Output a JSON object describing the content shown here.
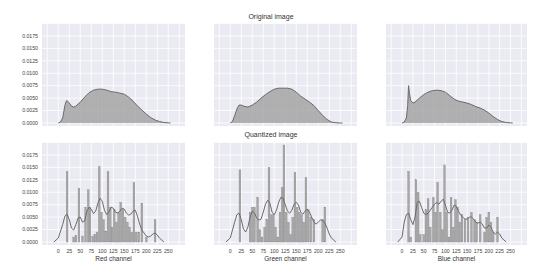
{
  "figure": {
    "titles": [
      "Original image",
      "Quantized image"
    ],
    "colors": {
      "background": "#eaeaf2",
      "grid": "#ffffff",
      "bar": "#9a9a9a",
      "line": "#6b6b6b",
      "fill": "#9a9a9a",
      "text": "#444444"
    }
  },
  "chart_data": [
    {
      "type": "area",
      "panel": "original-red",
      "title": "Original image",
      "xlabel": "",
      "ylabel": "",
      "ylim": [
        0,
        0.0201
      ],
      "xlim": [
        -37,
        288
      ],
      "yticks": [
        "0.0000",
        "0.0025",
        "0.0050",
        "0.0075",
        "0.0100",
        "0.0125",
        "0.0150",
        "0.0175"
      ],
      "x": [
        0,
        5,
        10,
        15,
        18,
        20,
        25,
        30,
        35,
        40,
        50,
        60,
        70,
        80,
        90,
        100,
        110,
        120,
        130,
        140,
        150,
        160,
        170,
        180,
        190,
        200,
        210,
        220,
        230,
        240,
        250,
        255
      ],
      "values": [
        0,
        0.0002,
        0.001,
        0.0035,
        0.0044,
        0.0045,
        0.004,
        0.0034,
        0.0032,
        0.0034,
        0.0042,
        0.0052,
        0.0061,
        0.0066,
        0.0068,
        0.0068,
        0.0066,
        0.0063,
        0.0062,
        0.006,
        0.0058,
        0.0052,
        0.0044,
        0.0034,
        0.0026,
        0.0018,
        0.0011,
        0.0006,
        0.0003,
        0.0001,
        3e-05,
        0
      ]
    },
    {
      "type": "area",
      "panel": "original-green",
      "title": "Original image",
      "ylim": [
        0,
        0.0201
      ],
      "xlim": [
        -37,
        288
      ],
      "x": [
        0,
        5,
        10,
        15,
        20,
        25,
        30,
        40,
        50,
        60,
        70,
        80,
        90,
        100,
        110,
        120,
        130,
        140,
        150,
        160,
        170,
        180,
        190,
        200,
        210,
        220,
        230,
        240,
        250,
        255
      ],
      "values": [
        0,
        0.0003,
        0.0015,
        0.0028,
        0.0036,
        0.0036,
        0.0034,
        0.0032,
        0.0036,
        0.0042,
        0.005,
        0.0057,
        0.0063,
        0.0068,
        0.007,
        0.007,
        0.007,
        0.0068,
        0.0062,
        0.0054,
        0.0048,
        0.0042,
        0.0035,
        0.0025,
        0.0015,
        0.0007,
        0.0002,
        5e-05,
        0,
        0
      ]
    },
    {
      "type": "area",
      "panel": "original-blue",
      "title": "Original image",
      "ylim": [
        0,
        0.0201
      ],
      "xlim": [
        -37,
        288
      ],
      "x": [
        0,
        5,
        10,
        13,
        15,
        17,
        20,
        25,
        30,
        40,
        50,
        60,
        70,
        80,
        90,
        100,
        110,
        120,
        130,
        140,
        150,
        160,
        170,
        180,
        190,
        200,
        210,
        220,
        230,
        240,
        250,
        255
      ],
      "values": [
        0,
        0.0002,
        0.001,
        0.0035,
        0.0075,
        0.006,
        0.0045,
        0.004,
        0.0042,
        0.005,
        0.0057,
        0.0062,
        0.0065,
        0.0066,
        0.0065,
        0.0062,
        0.0055,
        0.0048,
        0.0044,
        0.0042,
        0.004,
        0.0037,
        0.0033,
        0.003,
        0.0026,
        0.002,
        0.0013,
        0.0007,
        0.0003,
        0.0001,
        3e-05,
        0
      ]
    },
    {
      "type": "bar+kde",
      "panel": "quantized-red",
      "title": "Quantized image",
      "xlabel": "Red channel",
      "ylim": [
        0,
        0.0201
      ],
      "xlim": [
        -37,
        288
      ],
      "xticks": [
        "0",
        "25",
        "50",
        "75",
        "100",
        "125",
        "150",
        "175",
        "200",
        "225",
        "250"
      ],
      "yticks": [
        "0.0000",
        "0.0025",
        "0.0050",
        "0.0075",
        "0.0100",
        "0.0125",
        "0.0150",
        "0.0175"
      ],
      "bars": {
        "x": [
          20,
          35,
          40,
          47,
          55,
          62,
          68,
          72,
          78,
          83,
          88,
          93,
          98,
          103,
          108,
          113,
          118,
          122,
          127,
          132,
          137,
          142,
          147,
          152,
          157,
          162,
          167,
          172,
          177,
          183,
          190,
          200,
          220
        ],
        "values": [
          0.0142,
          0.001,
          0.0013,
          0.0108,
          0.0012,
          0.007,
          0.0105,
          0.007,
          0.0012,
          0.0015,
          0.002,
          0.0152,
          0.006,
          0.0045,
          0.0022,
          0.0142,
          0.007,
          0.003,
          0.0065,
          0.004,
          0.006,
          0.008,
          0.0065,
          0.005,
          0.004,
          0.003,
          0.002,
          0.012,
          0.002,
          0.002,
          0.0078,
          0.001,
          0.0045
        ]
      },
      "kde": {
        "x": [
          -10,
          0,
          10,
          15,
          20,
          25,
          30,
          35,
          40,
          45,
          50,
          55,
          60,
          65,
          70,
          75,
          80,
          85,
          90,
          95,
          100,
          105,
          110,
          115,
          120,
          125,
          130,
          135,
          140,
          145,
          150,
          155,
          160,
          165,
          170,
          175,
          180,
          185,
          190,
          195,
          200,
          205,
          210,
          215,
          220,
          225,
          230,
          240
        ],
        "values": [
          0,
          0.0008,
          0.0035,
          0.0052,
          0.0056,
          0.0045,
          0.0028,
          0.0024,
          0.0035,
          0.0048,
          0.005,
          0.004,
          0.0042,
          0.0062,
          0.007,
          0.0066,
          0.0057,
          0.0062,
          0.0078,
          0.0088,
          0.0082,
          0.0064,
          0.0055,
          0.006,
          0.007,
          0.0068,
          0.006,
          0.0058,
          0.0062,
          0.0068,
          0.0066,
          0.0058,
          0.0054,
          0.0056,
          0.0062,
          0.0064,
          0.0052,
          0.0036,
          0.0024,
          0.0018,
          0.0012,
          0.001,
          0.0012,
          0.0016,
          0.0018,
          0.0014,
          0.0008,
          0
        ]
      }
    },
    {
      "type": "bar+kde",
      "panel": "quantized-green",
      "title": "Quantized image",
      "xlabel": "Green channel",
      "ylim": [
        0,
        0.0201
      ],
      "xlim": [
        -37,
        288
      ],
      "xticks": [
        "0",
        "25",
        "50",
        "75",
        "100",
        "125",
        "150",
        "175",
        "200",
        "225",
        "250"
      ],
      "bars": {
        "x": [
          22,
          45,
          50,
          55,
          62,
          67,
          72,
          78,
          83,
          88,
          93,
          98,
          103,
          108,
          113,
          118,
          122,
          127,
          132,
          137,
          142,
          147,
          152,
          157,
          162,
          167,
          172,
          177,
          183,
          190,
          210,
          215
        ],
        "values": [
          0.0145,
          0.006,
          0.007,
          0.007,
          0.009,
          0.0025,
          0.001,
          0.003,
          0.0045,
          0.015,
          0.0055,
          0.0055,
          0.003,
          0.001,
          0.006,
          0.011,
          0.0195,
          0.006,
          0.004,
          0.0015,
          0.005,
          0.014,
          0.007,
          0.006,
          0.0055,
          0.004,
          0.013,
          0.0065,
          0.005,
          0.0045,
          0.0045,
          0.007
        ]
      },
      "kde": {
        "x": [
          -10,
          0,
          10,
          15,
          20,
          25,
          30,
          35,
          40,
          45,
          50,
          55,
          60,
          65,
          70,
          75,
          80,
          85,
          90,
          95,
          100,
          105,
          110,
          115,
          120,
          125,
          130,
          135,
          140,
          145,
          150,
          155,
          160,
          165,
          170,
          175,
          180,
          185,
          190,
          195,
          200,
          205,
          210,
          215,
          220,
          225,
          230,
          240
        ],
        "values": [
          0,
          0.0008,
          0.004,
          0.0055,
          0.0058,
          0.0045,
          0.0026,
          0.002,
          0.003,
          0.005,
          0.0062,
          0.0058,
          0.0048,
          0.0044,
          0.0046,
          0.006,
          0.0076,
          0.0084,
          0.0078,
          0.006,
          0.0055,
          0.0064,
          0.008,
          0.009,
          0.0088,
          0.0075,
          0.0062,
          0.0058,
          0.0064,
          0.0076,
          0.008,
          0.0074,
          0.006,
          0.0056,
          0.0062,
          0.0066,
          0.006,
          0.005,
          0.004,
          0.0036,
          0.004,
          0.0044,
          0.0044,
          0.0038,
          0.0028,
          0.0016,
          0.0008,
          0
        ]
      }
    },
    {
      "type": "bar+kde",
      "panel": "quantized-blue",
      "title": "Quantized image",
      "xlabel": "Blue channel",
      "ylim": [
        0,
        0.0201
      ],
      "xlim": [
        -37,
        288
      ],
      "xticks": [
        "0",
        "25",
        "50",
        "75",
        "100",
        "125",
        "150",
        "175",
        "200",
        "225",
        "250"
      ],
      "bars": {
        "x": [
          15,
          20,
          32,
          37,
          42,
          50,
          55,
          60,
          65,
          72,
          77,
          82,
          88,
          93,
          98,
          103,
          108,
          113,
          118,
          123,
          128,
          133,
          138,
          145,
          152,
          160,
          167,
          172,
          180,
          190,
          195,
          200,
          205,
          210,
          220
        ],
        "values": [
          0.0142,
          0.001,
          0.0125,
          0.01,
          0.0015,
          0.0015,
          0.0065,
          0.0087,
          0.003,
          0.009,
          0.006,
          0.012,
          0.006,
          0.0025,
          0.0155,
          0.006,
          0.001,
          0.009,
          0.003,
          0.0085,
          0.007,
          0.004,
          0.0055,
          0.0045,
          0.005,
          0.006,
          0.0045,
          0.004,
          0.0055,
          0.002,
          0.005,
          0.006,
          0.004,
          0.002,
          0.005
        ]
      },
      "kde": {
        "x": [
          -10,
          0,
          5,
          10,
          15,
          20,
          25,
          30,
          35,
          40,
          45,
          50,
          55,
          60,
          65,
          70,
          75,
          80,
          85,
          90,
          95,
          100,
          105,
          110,
          115,
          120,
          125,
          130,
          135,
          140,
          145,
          150,
          155,
          160,
          165,
          170,
          175,
          180,
          185,
          190,
          195,
          200,
          205,
          210,
          215,
          220,
          225,
          230,
          240
        ],
        "values": [
          0,
          0.001,
          0.004,
          0.0055,
          0.0058,
          0.0045,
          0.0035,
          0.005,
          0.008,
          0.0082,
          0.007,
          0.0058,
          0.0055,
          0.0058,
          0.0064,
          0.007,
          0.0076,
          0.008,
          0.0076,
          0.0082,
          0.0086,
          0.0074,
          0.006,
          0.0058,
          0.0064,
          0.0074,
          0.0072,
          0.0062,
          0.0054,
          0.005,
          0.0046,
          0.0046,
          0.005,
          0.005,
          0.0046,
          0.004,
          0.0038,
          0.004,
          0.0036,
          0.0028,
          0.0028,
          0.0034,
          0.003,
          0.002,
          0.0016,
          0.002,
          0.0016,
          0.0008,
          0
        ]
      }
    }
  ]
}
